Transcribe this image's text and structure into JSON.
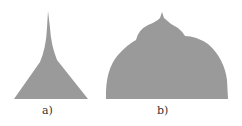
{
  "figure": {
    "panels": [
      {
        "label": "a)",
        "shape": "tapered-spike-triangle"
      },
      {
        "label": "b)",
        "shape": "multi-lobed-dome"
      }
    ],
    "fill_color": "#9a9a9a"
  }
}
